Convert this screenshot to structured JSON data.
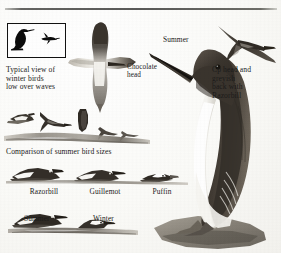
{
  "plate": {
    "title": "Auk identification plate",
    "domain_note": "scanned field-guide illustration page"
  },
  "rule": {
    "present": true
  },
  "silhouette_box": {
    "name": "winter-silhouette-inset",
    "figures": [
      {
        "name": "standing-auk-silhouette",
        "label": ""
      },
      {
        "name": "flying-auk-silhouette",
        "label": ""
      }
    ]
  },
  "labels": {
    "typical_view": "Typical view of\nwinter birds\nlow over waves",
    "typical_view_lines": [
      "Typical view of",
      "winter birds",
      "low over waves"
    ],
    "chocolate_head": "Chocolate\nhead",
    "chocolate_head_lines": [
      "Chocolate",
      "head"
    ],
    "summer_main": "Summer",
    "right_note": "Cp head and\ngreyish\nback with\nRazorbill",
    "right_note_lines": [
      "Cp head and",
      "greyish",
      "back with",
      "Razorbill"
    ],
    "comparison_heading": "Comparison of summer bird sizes",
    "bottom_summer": "Summer",
    "bottom_winter": "Winter"
  },
  "size_comparison": {
    "heading": "Comparison of summer bird sizes",
    "species": [
      {
        "name": "Razorbill",
        "relative_size": "largest"
      },
      {
        "name": "Guillemot",
        "relative_size": "medium"
      },
      {
        "name": "Puffin",
        "relative_size": "smallest"
      }
    ]
  },
  "plumage_comparison": {
    "items": [
      {
        "name": "Summer",
        "description": "dark-headed swimming guillemot"
      },
      {
        "name": "Winter",
        "description": "white-faced swimming guillemot"
      }
    ]
  },
  "figures": {
    "main_bird": {
      "name": "perched-guillemot-summer",
      "caption": "Summer"
    },
    "spread_wing_bird": {
      "name": "guillemot-underwing-view"
    },
    "flying_bird_right": {
      "name": "razorbill-in-flight"
    },
    "flying_flock": {
      "name": "winter-auks-low-over-waves",
      "count": 5
    },
    "wave_line": {
      "name": "sea-surface-line"
    }
  },
  "colors": {
    "ink": "#1a1a1a",
    "paper": "#fbfbf8",
    "dark_plumage": "#3a352f",
    "mid_grey": "#6e6a63",
    "light_grey": "#b4b0a9",
    "white_plumage": "#fbfbf9",
    "rule": "#3c3c3a"
  }
}
